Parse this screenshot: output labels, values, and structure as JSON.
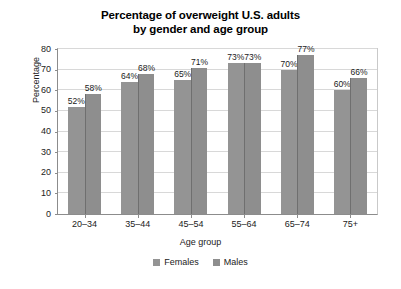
{
  "chart_data": {
    "type": "bar",
    "title": "Percentage of overweight U.S. adults by gender and age group",
    "title_lines": [
      "Percentage of overweight U.S. adults",
      "by gender and age group"
    ],
    "xlabel": "Age group",
    "ylabel": "Percentage",
    "categories": [
      "20–34",
      "35–44",
      "45–54",
      "55–64",
      "65–74",
      "75+"
    ],
    "series": [
      {
        "name": "Females",
        "color": "#949494",
        "values": [
          52,
          64,
          65,
          73,
          70,
          60
        ],
        "labels": [
          "52%",
          "64%",
          "65%",
          "73%",
          "70%",
          "60%"
        ]
      },
      {
        "name": "Males",
        "color": "#8e8e8e",
        "values": [
          58,
          68,
          71,
          73,
          77,
          66
        ],
        "labels": [
          "58%",
          "68%",
          "71%",
          "73%",
          "77%",
          "66%"
        ]
      }
    ],
    "ylim": [
      0,
      80
    ],
    "yticks": [
      0,
      10,
      20,
      30,
      40,
      50,
      60,
      70,
      80
    ],
    "ytick_labels": [
      "0",
      "10",
      "20",
      "30",
      "40",
      "50",
      "60",
      "70",
      "80"
    ],
    "grid": true,
    "legend_position": "bottom",
    "value_label_suffix": "%"
  }
}
